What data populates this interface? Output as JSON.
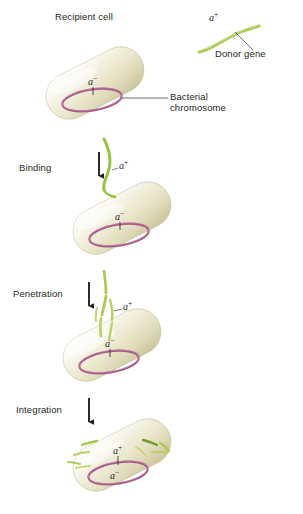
{
  "figure": {
    "title_hidden": "Bacterial transformation stages",
    "background_color": "#ffffff",
    "cell_fill_light": "#f6f4e4",
    "cell_fill_mid": "#e6e3c8",
    "cell_fill_shadow": "#cfcaa6",
    "chromosome_color": "#a55a86",
    "dna_color_donor": "#b7cf62",
    "dna_color_bright": "#8fc63d",
    "leader_color": "#231f20"
  },
  "labels": {
    "recipient_cell": "Recipient cell",
    "donor_gene": "Donor gene",
    "bacterial_chromosome_line1": "Bacterial",
    "bacterial_chromosome_line2": "chromosome"
  },
  "stages": [
    {
      "id": "binding",
      "label": "Binding"
    },
    {
      "id": "penetration",
      "label": "Penetration"
    },
    {
      "id": "integration",
      "label": "Integration"
    }
  ],
  "alleles": {
    "donor_plus": "a",
    "donor_plus_sign": "+",
    "recipient_minus": "a",
    "recipient_minus_sign": "−"
  },
  "cells": [
    {
      "id": "recipient",
      "stage": "recipient-cell",
      "allele_interior": "a−",
      "has_donor_dna_outside": false
    },
    {
      "id": "binding",
      "stage": "binding",
      "allele_interior": "a−",
      "allele_dna": "a+",
      "has_donor_dna_outside": true
    },
    {
      "id": "penetration",
      "stage": "penetration",
      "allele_interior": "a−",
      "allele_dna": "a+",
      "has_donor_dna_outside": true
    },
    {
      "id": "integration",
      "stage": "integration",
      "allele_interior": "a−",
      "allele_integrated": "a+",
      "has_donor_dna_outside": false
    }
  ]
}
